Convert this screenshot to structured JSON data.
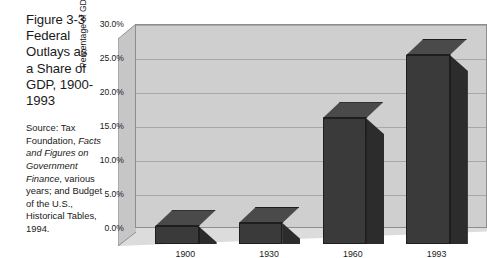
{
  "caption": {
    "title": "Figure 3-3 Federal Outlays as a Share of GDP, 1900-1993",
    "source_prefix": "Source: Tax Foundation, ",
    "source_italic_1": "Facts and Figures on Government Finance",
    "source_middle": ", various years; and Budget of the U.S., Historical Tables, 1994."
  },
  "chart_data": {
    "type": "bar",
    "title": "Federal Outlays as a Share of GDP, 1900-1993",
    "categories": [
      "1900",
      "1930",
      "1960",
      "1993"
    ],
    "values": [
      2.6,
      3.1,
      18.5,
      27.8
    ],
    "xlabel": "",
    "ylabel": "Percentage of GDP",
    "ylim": [
      0,
      30
    ],
    "ytick_values": [
      0,
      5,
      10,
      15,
      20,
      25,
      30
    ],
    "ytick_labels": [
      "0.0%",
      "5.0%",
      "10.0%",
      "15.0%",
      "20.0%",
      "25.0%",
      "30.0%"
    ],
    "grid": true,
    "legend": "none",
    "style": "3d-column",
    "colors": {
      "bar_front": "#3a3a3a",
      "bar_side": "#2c2c2c",
      "bar_top": "#4a4a4a",
      "plot_background": "#cfcfcf",
      "floor": "#dcdcdc",
      "left_wall": "#c6c6c6",
      "gridline": "#a8a8a8",
      "text": "#1a1a1a"
    }
  }
}
